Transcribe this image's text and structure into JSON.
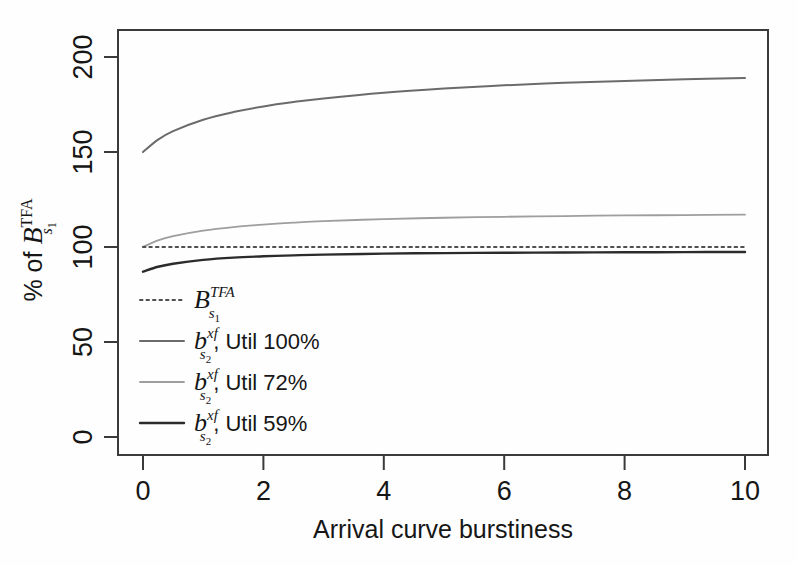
{
  "chart_data": {
    "type": "line",
    "title": "",
    "xlabel": "Arrival curve burstiness",
    "ylabel": "% of B_{s_1}^{TFA}",
    "ylabel_parts": {
      "prefix": "% of ",
      "base": "B",
      "sub": "s",
      "sub2": "1",
      "sup": "TFA"
    },
    "xlim": [
      0,
      10
    ],
    "ylim": [
      0,
      210
    ],
    "xticks": [
      0,
      2,
      4,
      6,
      8,
      10
    ],
    "xtick_labels": [
      "0",
      "2",
      "4",
      "6",
      "8",
      "10"
    ],
    "yticks": [
      0,
      50,
      100,
      150,
      200
    ],
    "ytick_labels": [
      "0",
      "50",
      "100",
      "150",
      "200"
    ],
    "grid": false,
    "legend_position": "inside-lower-left",
    "series": [
      {
        "name": "B_{s_1}^{TFA}",
        "legend_label_parts": {
          "base": "B",
          "sub": "s",
          "sub2": "1",
          "sup": "TFA",
          "suffix": ""
        },
        "style": "dotted",
        "color": "#4f4f4f",
        "width": 2.0,
        "x": [
          0,
          0.5,
          1,
          2,
          3,
          4,
          5,
          6,
          7,
          8,
          9,
          10
        ],
        "values": [
          100,
          100,
          100,
          100,
          100,
          100,
          100,
          100,
          100,
          100,
          100,
          100
        ]
      },
      {
        "name": "b_{s_2}^{xf}, Util 100%",
        "legend_label_parts": {
          "base": "b",
          "sub": "s",
          "sub2": "2",
          "sup": "xf",
          "suffix": ", Util 100%"
        },
        "style": "solid",
        "color": "#6b6b6b",
        "width": 2.0,
        "x": [
          0,
          0.25,
          0.5,
          1,
          1.5,
          2,
          2.5,
          3,
          4,
          5,
          6,
          7,
          8,
          9,
          10
        ],
        "values": [
          150.0,
          156.5,
          161.0,
          167.0,
          171.0,
          174.0,
          176.3,
          178.2,
          181.2,
          183.4,
          185.1,
          186.4,
          187.4,
          188.3,
          189.0
        ]
      },
      {
        "name": "b_{s_2}^{xf}, Util 72%",
        "legend_label_parts": {
          "base": "b",
          "sub": "s",
          "sub2": "2",
          "sup": "xf",
          "suffix": ", Util 72%"
        },
        "style": "solid",
        "color": "#9e9e9e",
        "width": 1.8,
        "x": [
          0,
          0.25,
          0.5,
          1,
          1.5,
          2,
          2.5,
          3,
          4,
          5,
          6,
          7,
          8,
          9,
          10
        ],
        "values": [
          100.0,
          103.5,
          105.7,
          108.6,
          110.5,
          111.8,
          112.8,
          113.6,
          114.7,
          115.4,
          115.9,
          116.3,
          116.6,
          116.8,
          117.0
        ]
      },
      {
        "name": "b_{s_2}^{xf}, Util 59%",
        "legend_label_parts": {
          "base": "b",
          "sub": "s",
          "sub2": "2",
          "sup": "xf",
          "suffix": ", Util 59%"
        },
        "style": "solid",
        "color": "#2b2b2b",
        "width": 2.4,
        "x": [
          0,
          0.25,
          0.5,
          1,
          1.5,
          2,
          2.5,
          3,
          4,
          5,
          6,
          7,
          8,
          9,
          10
        ],
        "values": [
          87.0,
          89.6,
          91.2,
          93.2,
          94.4,
          95.1,
          95.6,
          96.0,
          96.5,
          96.8,
          97.0,
          97.1,
          97.2,
          97.3,
          97.4
        ]
      }
    ]
  },
  "legend": {
    "entries": [
      {
        "label": "B_{s_1}^{TFA}",
        "style": "dotted",
        "color": "#4f4f4f"
      },
      {
        "label": "b_{s_2}^{xf}, Util 100%",
        "style": "solid",
        "color": "#6b6b6b"
      },
      {
        "label": "b_{s_2}^{xf}, Util 72%",
        "style": "solid",
        "color": "#9e9e9e"
      },
      {
        "label": "b_{s_2}^{xf}, Util 59%",
        "style": "solid",
        "color": "#2b2b2b"
      }
    ]
  },
  "axes": {
    "frame_color": "#3a3a3a",
    "tick_color": "#3a3a3a"
  }
}
